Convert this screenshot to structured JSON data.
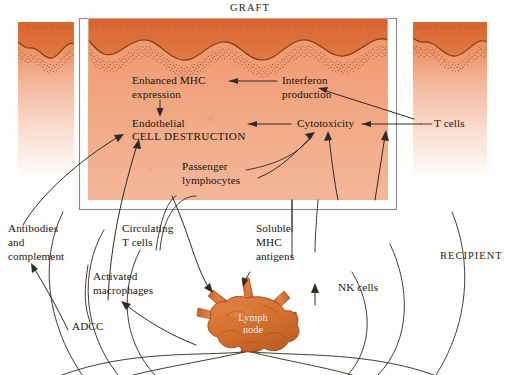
{
  "figure": {
    "title": "GRAFT",
    "recipient_label": "RECIPIENT",
    "colors": {
      "tissue_top": "#d9622f",
      "tissue_mid": "#e8835a",
      "tissue_body": "#f0a987",
      "tissue_fade": "#ffffff",
      "node_fill": "#d4702f",
      "node_shade": "#b85a22",
      "line": "#2f2a26",
      "box_border": "#5a5a5a",
      "text": "#1c140f"
    }
  },
  "graft_box": {
    "labels": [
      {
        "id": "enhanced-mhc",
        "lines": [
          "Enhanced MHC",
          "expression"
        ],
        "style": "normal"
      },
      {
        "id": "endothelial",
        "lines": [
          "Endothelial"
        ],
        "style": "normal"
      },
      {
        "id": "cell-destruction",
        "lines": [
          "CELL DESTRUCTION"
        ],
        "style": "caps"
      },
      {
        "id": "interferon",
        "lines": [
          "Interferon",
          "production"
        ],
        "style": "normal"
      },
      {
        "id": "cytotoxicity",
        "lines": [
          "Cytotoxicity"
        ],
        "style": "normal"
      },
      {
        "id": "passenger-lymphocytes",
        "lines": [
          "Passenger",
          "lymphocytes"
        ],
        "style": "normal"
      }
    ],
    "text": {
      "enhanced_mhc_l1": "Enhanced MHC",
      "enhanced_mhc_l2": "expression",
      "endothelial": "Endothelial",
      "cell_destruction": "CELL DESTRUCTION",
      "interferon_l1": "Interferon",
      "interferon_l2": "production",
      "cytotoxicity": "Cytotoxicity",
      "passenger_l1": "Passenger",
      "passenger_l2": "lymphocytes"
    }
  },
  "outside_labels": {
    "t_cells": "T cells",
    "antibodies_l1": "Antibodies",
    "antibodies_l2": "and",
    "antibodies_l3": "complement",
    "circulating_l1": "Circulating",
    "circulating_l2": "T cells",
    "activated_l1": "Activated",
    "activated_l2": "macrophages",
    "adcc": "ADCC",
    "soluble_l1": "Soluble",
    "soluble_l2": "MHC",
    "soluble_l3": "antigens",
    "nk_cells": "NK cells",
    "lymph_node_l1": "Lymph",
    "lymph_node_l2": "node"
  },
  "structures": {
    "graft_panels": [
      "left-graft-panel",
      "center-graft-panel",
      "right-graft-panel"
    ],
    "organ": "lymph-node",
    "tissue_surface": "wavy-epithelium-with-stippled-basement-membrane"
  }
}
